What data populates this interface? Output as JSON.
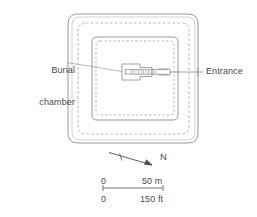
{
  "figure": {
    "kind": "archaeological-site-plan",
    "background_color": "#ffffff",
    "line_color": "#8c8c8c",
    "text_color": "#4a4a4a"
  },
  "labels": {
    "burial_chamber_line1": "Burial",
    "burial_chamber_line2": "chamber",
    "entrance": "Entrance"
  },
  "compass": {
    "direction_label": "N"
  },
  "scale": {
    "metric_zero": "0",
    "metric_value": "50 m",
    "imperial_zero": "0",
    "imperial_value": "150 ft"
  }
}
